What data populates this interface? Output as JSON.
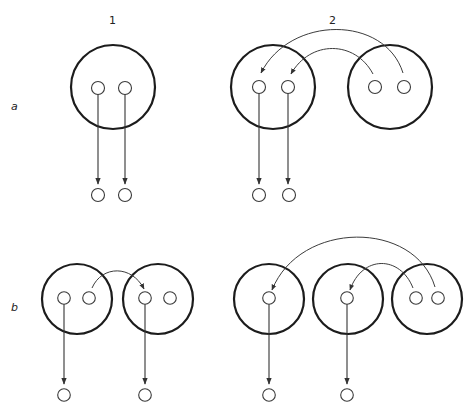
{
  "diagram": {
    "column_labels": [
      "1",
      "2"
    ],
    "row_labels": [
      "a",
      "b"
    ],
    "colors": {
      "stroke": "#1c1c1c",
      "background": "#ffffff"
    },
    "panels": [
      {
        "id": "a1",
        "description": "One large circle containing two small circles; each small circle has a straight downward arrow to a small circle below.",
        "large_circles": 1,
        "transfers_between_circles": 0
      },
      {
        "id": "a2",
        "description": "Two large circles; curved arrows carry the two small circles from the right large circle into the left one; from there two straight downward arrows lead to small circles below.",
        "large_circles": 2,
        "transfers_between_circles": 2
      },
      {
        "id": "b1",
        "description": "Two large circles, each with two small circles; a curved arrow goes from the second small circle of the left large circle to the first small circle of the right large circle; each large circle has one downward arrow.",
        "large_circles": 2,
        "transfers_between_circles": 1
      },
      {
        "id": "b2",
        "description": "Three large circles; the right one contains two small circles, and curved arrows send them to the single small circle in each of the other two large circles; each of those has one downward arrow.",
        "large_circles": 3,
        "transfers_between_circles": 2
      }
    ]
  }
}
